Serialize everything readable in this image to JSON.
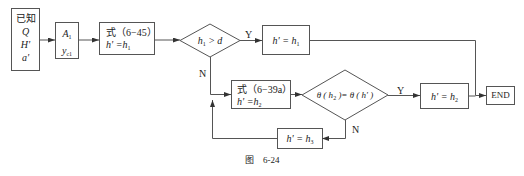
{
  "nodes": {
    "known": {
      "lines": [
        "已知",
        "Q",
        "H'",
        "a'"
      ]
    },
    "a1_yc1": {
      "line1_main": "A",
      "line1_sub": "1",
      "line2_main": "y",
      "line2_sub": "c1"
    },
    "eq645": {
      "line1": "式（6−45）",
      "line2_main": "h' =h",
      "line2_sub": "1"
    },
    "dec1": {
      "main": "h",
      "sub": "1",
      "rest": " > d"
    },
    "set_h1": {
      "main": "h'  = h",
      "sub": "1"
    },
    "eq639a": {
      "line1": "式（6−39a）",
      "line2_main": "h' =h",
      "line2_sub": "2"
    },
    "dec2": {
      "text_a": "θ ( h",
      "sub": "2",
      "text_b": " )= θ ( h' )"
    },
    "set_h2": {
      "main": "h'  = h",
      "sub": "2"
    },
    "set_h3": {
      "main": "h'  = h",
      "sub": "3"
    },
    "end": {
      "label": "END"
    }
  },
  "edge_labels": {
    "dec1_yes": "Y",
    "dec1_no": "N",
    "dec2_yes": "Y",
    "dec2_no": "N"
  },
  "caption": "图    6-24",
  "colors": {
    "stroke": "#555555",
    "text": "#222222"
  }
}
